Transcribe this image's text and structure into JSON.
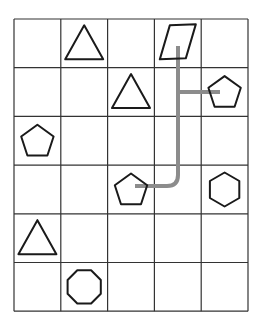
{
  "grid": {
    "columns": 5,
    "rows": 6,
    "origin": [
      14,
      19
    ],
    "cell_width": 46.8,
    "cell_height": 48.7,
    "line_color": "#333333"
  },
  "shapes": [
    {
      "type": "triangle",
      "row": 0,
      "col": 1
    },
    {
      "type": "parallelogram",
      "row": 0,
      "col": 3
    },
    {
      "type": "triangle",
      "row": 1,
      "col": 2
    },
    {
      "type": "pentagon",
      "row": 1,
      "col": 4
    },
    {
      "type": "pentagon",
      "row": 2,
      "col": 0
    },
    {
      "type": "pentagon",
      "row": 3,
      "col": 2
    },
    {
      "type": "hexagon",
      "row": 3,
      "col": 4
    },
    {
      "type": "triangle",
      "row": 4,
      "col": 0
    },
    {
      "type": "octagon",
      "row": 5,
      "col": 1
    }
  ],
  "path": {
    "color": "#8c8c8c",
    "description": "Gray connector from parallelogram (row 0, col 3) down to pentagon (row 3, col 2), with a branch to pentagon (row 1, col 4)"
  },
  "stroke_color": "#1a1a1a"
}
